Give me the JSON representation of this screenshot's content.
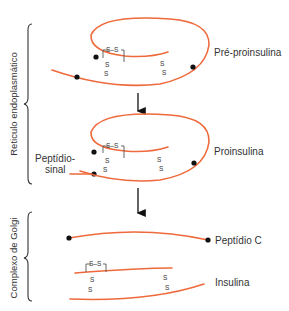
{
  "diagram": {
    "colors": {
      "chain": "#ee6a3c",
      "bond": "#555555",
      "dot": "#111111",
      "text": "#333333"
    },
    "regions": [
      {
        "id": "er",
        "label": "Reticulo endoplasmático"
      },
      {
        "id": "golgi",
        "label": "Complexo de Golgi"
      }
    ],
    "stages": [
      {
        "id": "pre",
        "label": "Pré-proinsulina"
      },
      {
        "id": "pro",
        "label": "Proinsulina"
      },
      {
        "id": "cpep",
        "label": "Peptídio C"
      },
      {
        "id": "ins",
        "label": "Insulina"
      }
    ],
    "signal_peptide": {
      "line1": "Peptídio-",
      "line2": "sinal"
    },
    "bond_atom": "S",
    "bond_text": "S–S"
  }
}
